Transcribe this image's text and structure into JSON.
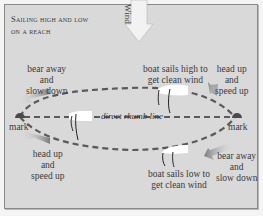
{
  "title": {
    "line1": "Sailing high and low",
    "line2": "on a reach"
  },
  "wind": {
    "label": "Wind",
    "arrow_color": "#f2f2f2",
    "direction": "down"
  },
  "marks": {
    "left_label": "mark",
    "right_label": "mark",
    "color": "#4a4a4a"
  },
  "rhumb_line": {
    "label": "direct rhumb line"
  },
  "labels": {
    "top_left": [
      "bear away",
      "and",
      "slow down"
    ],
    "top_center": [
      "boat sails high to",
      "get clean wind"
    ],
    "top_right": [
      "head up",
      "and",
      "speed up"
    ],
    "bottom_left": [
      "head up",
      "and",
      "speed up"
    ],
    "bottom_center": [
      "boat sails low to",
      "get clean wind"
    ],
    "bottom_right": [
      "bear away",
      "and",
      "slow down"
    ]
  },
  "colors": {
    "background": "#d9d9d9",
    "dashed_path": "#5a5a5a",
    "boat_hull": "#ffffff",
    "arrow_gray": "#8c8c8c",
    "text": "#3a3a3a"
  }
}
